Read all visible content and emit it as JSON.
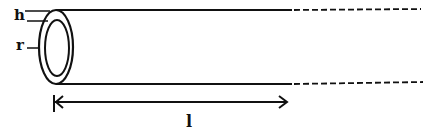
{
  "diagram": {
    "type": "hollow cylindrical tube (pipe) with wall thickness and length",
    "labels": {
      "thickness": "h",
      "radius": "r",
      "length": "l"
    },
    "colors": {
      "stroke": "#111111",
      "background": "#ffffff"
    }
  }
}
